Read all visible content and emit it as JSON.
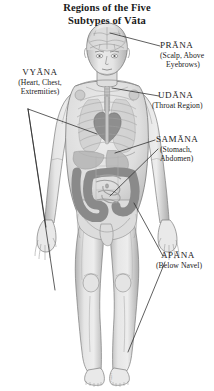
{
  "title": {
    "line1": "Regions of the Five",
    "line2": "Subtypes of Vāta"
  },
  "figure": {
    "credit": "© jm.i.n"
  },
  "labels": [
    {
      "id": "prana",
      "name": "PRĀNA",
      "detail_line1": "(Scalp, Above",
      "detail_line2": "Eyebrows)"
    },
    {
      "id": "vyana",
      "name": "VYĀNA",
      "detail_line1": "(Heart, Chest,",
      "detail_line2": "Extremities)"
    },
    {
      "id": "udana",
      "name": "UDĀNA",
      "detail_line1": "(Throat Region)",
      "detail_line2": ""
    },
    {
      "id": "samana",
      "name": "SAMĀNA",
      "detail_line1": "(Stomach,",
      "detail_line2": "Abdomen)"
    },
    {
      "id": "apana",
      "name": "APĀNA",
      "detail_line1": "(Below Navel)",
      "detail_line2": ""
    }
  ],
  "colors": {
    "background": "#ffffff",
    "text": "#1a1a1a",
    "leader_line": "#2a2a2a",
    "skin_light": "#e8e8e8",
    "skin_mid": "#cfcfcf",
    "skin_shadow": "#a9a9a9",
    "organ_gray": "#9a9a9a",
    "intestine_gray": "#8c8c8c",
    "bone_gray": "#bdbdbd",
    "outline": "#6f6f6f"
  }
}
